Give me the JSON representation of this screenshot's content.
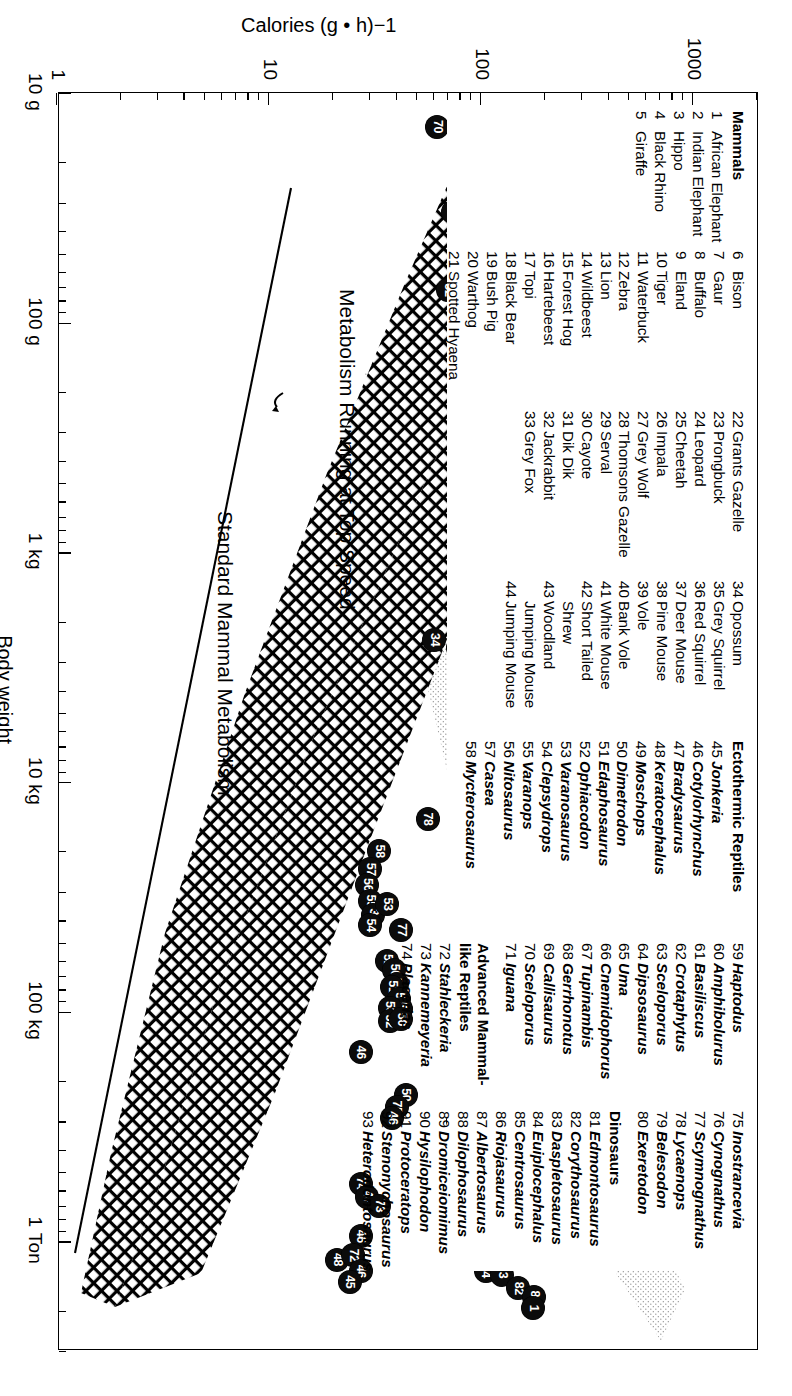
{
  "figure": {
    "axes": {
      "x_title": "Body weight",
      "y_title": "Calories (g • h)−1",
      "x_ticklabels": [
        "10 g",
        "100 g",
        "1 kg",
        "10 kg",
        "100 kg",
        "1 Ton"
      ],
      "y_ticklabels": [
        "1",
        "10",
        "100",
        "1000"
      ],
      "x_scale": "log",
      "y_scale": "log"
    },
    "annotations": [
      {
        "text": "Metabolism Running at Top Speed"
      },
      {
        "text": "Standard Mammal Metabolism"
      }
    ]
  },
  "chart_data": {
    "type": "scatter",
    "title": "",
    "xlabel": "Body weight",
    "ylabel": "Calories (g • h)−1",
    "xlim": [
      10,
      3000000
    ],
    "ylim": [
      1,
      2000
    ],
    "x_scale": "log",
    "y_scale": "log",
    "x_tick_values": [
      10,
      100,
      1000,
      10000,
      100000,
      1000000
    ],
    "x_tick_labels": [
      "10 g",
      "100 g",
      "1 kg",
      "10 kg",
      "100 kg",
      "1 Ton"
    ],
    "y_tick_values": [
      1,
      10,
      100,
      1000
    ],
    "y_tick_labels": [
      "1",
      "10",
      "100",
      "1000"
    ],
    "grid": false,
    "legend_position": "inside-upper-left",
    "bands": [
      {
        "name": "Metabolism Running at Top Speed",
        "fill": "crosshatch",
        "description": "Upper broad cross-hatched wedge spanning mammal running metabolism"
      },
      {
        "name": "Ectothermic / dinosaur stippled band",
        "fill": "stipple",
        "description": "Light stippled band lying above the cross-hatched wedge at large body weights"
      }
    ],
    "reference_lines": [
      {
        "name": "Standard Mammal Metabolism",
        "type": "power-law",
        "description": "Straight descending line on log-log axes below the main wedge"
      }
    ],
    "series": [
      {
        "name": "Plotted taxa (numbered markers)",
        "marker": "filled-circle-with-number",
        "points": [
          {
            "id": "70",
            "x": 14,
            "y": 62
          },
          {
            "id": "69",
            "x": 22,
            "y": 290
          },
          {
            "id": "44",
            "x": 26,
            "y": 92
          },
          {
            "id": "41",
            "x": 29,
            "y": 118
          },
          {
            "id": "39",
            "x": 34,
            "y": 122
          },
          {
            "id": "43",
            "x": 37,
            "y": 103
          },
          {
            "id": "68",
            "x": 33,
            "y": 74
          },
          {
            "id": "66",
            "x": 36,
            "y": 192
          },
          {
            "id": "65",
            "x": 44,
            "y": 176
          },
          {
            "id": "64",
            "x": 50,
            "y": 200
          },
          {
            "id": "37",
            "x": 46,
            "y": 134
          },
          {
            "id": "38",
            "x": 55,
            "y": 131
          },
          {
            "id": "37b",
            "x": 66,
            "y": 130
          },
          {
            "id": "67",
            "x": 62,
            "y": 101
          },
          {
            "id": "52",
            "x": 72,
            "y": 70
          },
          {
            "id": "62",
            "x": 74,
            "y": 168
          },
          {
            "id": "63",
            "x": 86,
            "y": 122
          },
          {
            "id": "35",
            "x": 120,
            "y": 152
          },
          {
            "id": "61",
            "x": 140,
            "y": 118
          },
          {
            "id": "60",
            "x": 210,
            "y": 98
          },
          {
            "id": "36",
            "x": 430,
            "y": 95
          },
          {
            "id": "34",
            "x": 2400,
            "y": 60
          },
          {
            "id": "59",
            "x": 2000,
            "y": 88
          },
          {
            "id": "57",
            "x": 2600,
            "y": 78
          },
          {
            "id": "79",
            "x": 3100,
            "y": 80
          },
          {
            "id": "33",
            "x": 5200,
            "y": 138
          },
          {
            "id": "32",
            "x": 6300,
            "y": 138
          },
          {
            "id": "93",
            "x": 7600,
            "y": 141
          },
          {
            "id": "31",
            "x": 9000,
            "y": 141
          },
          {
            "id": "92",
            "x": 11000,
            "y": 143
          },
          {
            "id": "30",
            "x": 12500,
            "y": 128
          },
          {
            "id": "78",
            "x": 14500,
            "y": 56
          },
          {
            "id": "28",
            "x": 19000,
            "y": 124
          },
          {
            "id": "91",
            "x": 27000,
            "y": 102
          },
          {
            "id": "90",
            "x": 38000,
            "y": 112
          },
          {
            "id": "23",
            "x": 44000,
            "y": 114
          },
          {
            "id": "26",
            "x": 49000,
            "y": 117
          },
          {
            "id": "21",
            "x": 54000,
            "y": 119
          },
          {
            "id": "27",
            "x": 49000,
            "y": 104
          },
          {
            "id": "25",
            "x": 43000,
            "y": 135
          },
          {
            "id": "22",
            "x": 62000,
            "y": 113
          },
          {
            "id": "20",
            "x": 70000,
            "y": 120
          },
          {
            "id": "89",
            "x": 66000,
            "y": 129
          },
          {
            "id": "3",
            "x": 76000,
            "y": 127
          },
          {
            "id": "17",
            "x": 82000,
            "y": 128
          },
          {
            "id": "16",
            "x": 76000,
            "y": 142
          },
          {
            "id": "18",
            "x": 92000,
            "y": 124
          },
          {
            "id": "12",
            "x": 105000,
            "y": 142
          },
          {
            "id": "11",
            "x": 120000,
            "y": 148
          },
          {
            "id": "13",
            "x": 118000,
            "y": 131
          },
          {
            "id": "58",
            "x": 20000,
            "y": 33
          },
          {
            "id": "57b",
            "x": 24000,
            "y": 30
          },
          {
            "id": "56",
            "x": 28000,
            "y": 29
          },
          {
            "id": "55",
            "x": 33000,
            "y": 30
          },
          {
            "id": "34b",
            "x": 38000,
            "y": 31
          },
          {
            "id": "53",
            "x": 34000,
            "y": 36
          },
          {
            "id": "54",
            "x": 42000,
            "y": 30
          },
          {
            "id": "77",
            "x": 44000,
            "y": 42
          },
          {
            "id": "52b",
            "x": 60000,
            "y": 36
          },
          {
            "id": "50",
            "x": 66000,
            "y": 39
          },
          {
            "id": "50b",
            "x": 76000,
            "y": 40
          },
          {
            "id": "51",
            "x": 78000,
            "y": 38
          },
          {
            "id": "50c",
            "x": 88000,
            "y": 41
          },
          {
            "id": "50d",
            "x": 97000,
            "y": 42
          },
          {
            "id": "53b",
            "x": 96000,
            "y": 37
          },
          {
            "id": "52c",
            "x": 110000,
            "y": 37
          },
          {
            "id": "50e",
            "x": 108000,
            "y": 42
          },
          {
            "id": "46",
            "x": 150000,
            "y": 27
          },
          {
            "id": "50f",
            "x": 230000,
            "y": 44
          },
          {
            "id": "75",
            "x": 260000,
            "y": 40
          },
          {
            "id": "46b",
            "x": 290000,
            "y": 38
          },
          {
            "id": "88",
            "x": 300000,
            "y": 78
          },
          {
            "id": "82",
            "x": 330000,
            "y": 95
          },
          {
            "id": "8",
            "x": 500000,
            "y": 112
          },
          {
            "id": "87",
            "x": 560000,
            "y": 117
          },
          {
            "id": "6",
            "x": 620000,
            "y": 123
          },
          {
            "id": "5",
            "x": 700000,
            "y": 131
          },
          {
            "id": "85",
            "x": 660000,
            "y": 110
          },
          {
            "id": "4",
            "x": 760000,
            "y": 118
          },
          {
            "id": "74",
            "x": 560000,
            "y": 27
          },
          {
            "id": "47",
            "x": 640000,
            "y": 29
          },
          {
            "id": "73",
            "x": 700000,
            "y": 33
          },
          {
            "id": "46c",
            "x": 950000,
            "y": 27
          },
          {
            "id": "48",
            "x": 1200000,
            "y": 21
          },
          {
            "id": "72",
            "x": 1150000,
            "y": 25
          },
          {
            "id": "46d",
            "x": 1350000,
            "y": 27
          },
          {
            "id": "45",
            "x": 1500000,
            "y": 24
          },
          {
            "id": "85b",
            "x": 1150000,
            "y": 103
          },
          {
            "id": "83",
            "x": 1200000,
            "y": 128
          },
          {
            "id": "84",
            "x": 1350000,
            "y": 105
          },
          {
            "id": "3b",
            "x": 1400000,
            "y": 126
          },
          {
            "id": "82b",
            "x": 1600000,
            "y": 150
          },
          {
            "id": "81",
            "x": 1750000,
            "y": 178
          },
          {
            "id": "1",
            "x": 1950000,
            "y": 176
          }
        ]
      }
    ]
  },
  "legend": {
    "columns": [
      {
        "header": "Mammals",
        "entries": [
          {
            "n": "1",
            "name": "African Elephant"
          },
          {
            "n": "2",
            "name": "Indian Elephant"
          },
          {
            "n": "3",
            "name": "Hippo"
          },
          {
            "n": "4",
            "name": "Black Rhino"
          },
          {
            "n": "5",
            "name": "Giraffe"
          }
        ]
      },
      {
        "header": "",
        "entries": [
          {
            "n": "6",
            "name": "Bison"
          },
          {
            "n": "7",
            "name": "Gaur"
          },
          {
            "n": "8",
            "name": "Buffalo"
          },
          {
            "n": "9",
            "name": "Eland"
          },
          {
            "n": "10",
            "name": "Tiger"
          },
          {
            "n": "11",
            "name": "Waterbuck"
          },
          {
            "n": "12",
            "name": "Zebra"
          },
          {
            "n": "13",
            "name": "Lion"
          },
          {
            "n": "14",
            "name": "Wildbeest"
          },
          {
            "n": "15",
            "name": "Forest Hog"
          },
          {
            "n": "16",
            "name": "Hartebeest"
          },
          {
            "n": "17",
            "name": "Topi"
          },
          {
            "n": "18",
            "name": "Black Bear"
          },
          {
            "n": "19",
            "name": "Bush Pig"
          },
          {
            "n": "20",
            "name": "Warthog"
          },
          {
            "n": "21",
            "name": "Spotted Hyaena"
          }
        ]
      },
      {
        "header": "",
        "entries": [
          {
            "n": "22",
            "name": "Grants Gazelle"
          },
          {
            "n": "23",
            "name": "Prongbuck"
          },
          {
            "n": "24",
            "name": "Leopard"
          },
          {
            "n": "25",
            "name": "Cheetah"
          },
          {
            "n": "26",
            "name": "Impala"
          },
          {
            "n": "27",
            "name": "Grey Wolf"
          },
          {
            "n": "28",
            "name": "Thomsons Gazelle"
          },
          {
            "n": "29",
            "name": "Serval"
          },
          {
            "n": "30",
            "name": "Cayote"
          },
          {
            "n": "31",
            "name": "Dik Dik"
          },
          {
            "n": "32",
            "name": "Jackrabbit"
          },
          {
            "n": "33",
            "name": "Grey Fox"
          }
        ]
      },
      {
        "header": "",
        "entries": [
          {
            "n": "34",
            "name": "Opossum"
          },
          {
            "n": "35",
            "name": "Grey Squirrel"
          },
          {
            "n": "36",
            "name": "Red Squirrel"
          },
          {
            "n": "37",
            "name": "Deer Mouse"
          },
          {
            "n": "38",
            "name": "Pine Mouse"
          },
          {
            "n": "39",
            "name": "Vole"
          },
          {
            "n": "40",
            "name": "Bank Vole"
          },
          {
            "n": "41",
            "name": "White Mouse"
          },
          {
            "n": "42",
            "name": "Short Tailed",
            "cont": "Shrew"
          },
          {
            "n": "43",
            "name": "Woodland",
            "cont": "Jumping Mouse"
          },
          {
            "n": "44",
            "name": "Jumping Mouse"
          }
        ]
      },
      {
        "header": "Ectothermic Reptiles",
        "italic": true,
        "entries": [
          {
            "n": "45",
            "name": "Jonkeria"
          },
          {
            "n": "46",
            "name": "Cotylorhynchus"
          },
          {
            "n": "47",
            "name": "Bradysaurus"
          },
          {
            "n": "48",
            "name": "Keratocephalus"
          },
          {
            "n": "49",
            "name": "Moschops"
          },
          {
            "n": "50",
            "name": "Dimetrodon"
          },
          {
            "n": "51",
            "name": "Edaphosaurus"
          },
          {
            "n": "52",
            "name": "Ophiacodon"
          },
          {
            "n": "53",
            "name": "Varanosaurus"
          },
          {
            "n": "54",
            "name": "Clepsydrops"
          },
          {
            "n": "55",
            "name": "Varanops"
          },
          {
            "n": "56",
            "name": "Nitosaurus"
          },
          {
            "n": "57",
            "name": "Casea"
          },
          {
            "n": "58",
            "name": "Mycterosaurus"
          }
        ]
      },
      {
        "header": "",
        "italic": true,
        "entries": [
          {
            "n": "59",
            "name": "Haptodus"
          },
          {
            "n": "60",
            "name": "Amphibolurus"
          },
          {
            "n": "61",
            "name": "Basiliscus"
          },
          {
            "n": "62",
            "name": "Crotaphytus"
          },
          {
            "n": "63",
            "name": "Sceloporus"
          },
          {
            "n": "64",
            "name": "Dipsosaurus"
          },
          {
            "n": "65",
            "name": "Uma"
          },
          {
            "n": "66",
            "name": "Cnemidophorus"
          },
          {
            "n": "67",
            "name": "Tupinambis"
          },
          {
            "n": "68",
            "name": "Gerrhonotus"
          },
          {
            "n": "69",
            "name": "Callisaurus"
          },
          {
            "n": "70",
            "name": "Sceloporus"
          },
          {
            "n": "71",
            "name": "Iguana"
          }
        ],
        "sub_header": "Advanced Mammal-like Reptiles",
        "sub_entries": [
          {
            "n": "72",
            "name": "Stahleckeria"
          },
          {
            "n": "73",
            "name": "Kannemeyeria"
          },
          {
            "n": "74",
            "name": "Placerias"
          }
        ]
      },
      {
        "header": "",
        "italic": true,
        "entries": [
          {
            "n": "75",
            "name": "Inostrancevia"
          },
          {
            "n": "76",
            "name": "Cynognathus"
          },
          {
            "n": "77",
            "name": "Scymnognathus"
          },
          {
            "n": "78",
            "name": "Lycaenops"
          },
          {
            "n": "79",
            "name": "Belesodon"
          },
          {
            "n": "80",
            "name": "Exeretodon"
          }
        ],
        "sub_header": "Dinosaurs",
        "sub_entries": [
          {
            "n": "81",
            "name": "Edmontosaurus"
          },
          {
            "n": "82",
            "name": "Corythosaurus"
          },
          {
            "n": "83",
            "name": "Daspletosaurus"
          },
          {
            "n": "84",
            "name": "Euiplocephalus"
          },
          {
            "n": "85",
            "name": "Centrosaurus"
          },
          {
            "n": "86",
            "name": "Riojasaurus"
          },
          {
            "n": "87",
            "name": "Albertosaurus"
          },
          {
            "n": "88",
            "name": "Dilophosaurus"
          },
          {
            "n": "89",
            "name": "Dromiceiomimus"
          },
          {
            "n": "90",
            "name": "Hysilophodon"
          },
          {
            "n": "91",
            "name": "Protoceratops"
          },
          {
            "n": "92",
            "name": "Stenonychosaurus"
          },
          {
            "n": "93",
            "name": "Heterodontosaurus"
          }
        ]
      }
    ]
  }
}
